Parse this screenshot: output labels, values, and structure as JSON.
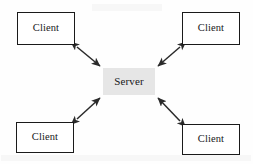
{
  "diagram": {
    "type": "star-topology",
    "canvas": {
      "width": 253,
      "height": 164,
      "background": "#fefefe"
    },
    "center": {
      "id": "server",
      "label": "Server",
      "shape": "rectangle",
      "fill": "#e6e6e6",
      "stroke": "none",
      "x": 103,
      "y": 68,
      "width": 52,
      "height": 27
    },
    "nodes": [
      {
        "id": "client-top-left",
        "label": "Client",
        "shape": "rectangle",
        "fill": "#ffffff",
        "stroke": "#1a1a1a",
        "x": 17,
        "y": 12,
        "width": 58,
        "height": 33
      },
      {
        "id": "client-top-right",
        "label": "Client",
        "shape": "rectangle",
        "fill": "#ffffff",
        "stroke": "#1a1a1a",
        "x": 182,
        "y": 12,
        "width": 58,
        "height": 33
      },
      {
        "id": "client-bottom-left",
        "label": "Client",
        "shape": "rectangle",
        "fill": "#ffffff",
        "stroke": "#1a1a1a",
        "x": 16,
        "y": 122,
        "width": 58,
        "height": 31
      },
      {
        "id": "client-bottom-right",
        "label": "Client",
        "shape": "rectangle",
        "fill": "#ffffff",
        "stroke": "#1a1a1a",
        "x": 182,
        "y": 124,
        "width": 58,
        "height": 31
      }
    ],
    "connectors": [
      {
        "id": "link-top-left",
        "from": "client-top-left",
        "to": "server",
        "style": "double-arrow",
        "color": "#2a2a2a",
        "x1": 77,
        "y1": 47,
        "x2": 100,
        "y2": 66
      },
      {
        "id": "link-top-right",
        "from": "client-top-right",
        "to": "server",
        "style": "double-arrow",
        "color": "#2a2a2a",
        "x1": 180,
        "y1": 47,
        "x2": 158,
        "y2": 66
      },
      {
        "id": "link-bottom-left",
        "from": "client-bottom-left",
        "to": "server",
        "style": "double-arrow",
        "color": "#2a2a2a",
        "x1": 77,
        "y1": 119,
        "x2": 100,
        "y2": 98
      },
      {
        "id": "link-bottom-right",
        "from": "client-bottom-right",
        "to": "server",
        "style": "double-arrow",
        "color": "#2a2a2a",
        "x1": 180,
        "y1": 121,
        "x2": 158,
        "y2": 98
      }
    ]
  }
}
